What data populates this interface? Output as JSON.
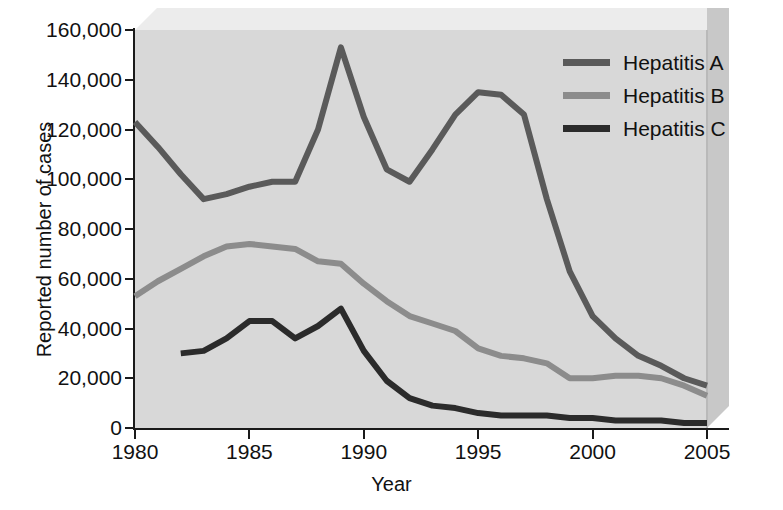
{
  "chart_data": {
    "type": "line",
    "title": "",
    "xlabel": "Year",
    "ylabel": "Reported number of cases",
    "xlim": [
      1980,
      2005
    ],
    "ylim": [
      0,
      160000
    ],
    "grid": false,
    "legend_position": "top-right",
    "x_ticks": [
      "1980",
      "1985",
      "1990",
      "1995",
      "2000",
      "2005"
    ],
    "x_tick_values": [
      1980,
      1985,
      1990,
      1995,
      2000,
      2005
    ],
    "y_ticks": [
      "0",
      "20,000",
      "40,000",
      "60,000",
      "80,000",
      "100,000",
      "120,000",
      "140,000",
      "160,000"
    ],
    "y_tick_values": [
      0,
      20000,
      40000,
      60000,
      80000,
      100000,
      120000,
      140000,
      160000
    ],
    "series": [
      {
        "name": "Hepatitis A",
        "color": "#5a5a5a",
        "x": [
          1980,
          1981,
          1982,
          1983,
          1984,
          1985,
          1986,
          1987,
          1988,
          1989,
          1990,
          1991,
          1992,
          1993,
          1994,
          1995,
          1996,
          1997,
          1998,
          1999,
          2000,
          2001,
          2002,
          2003,
          2004,
          2005
        ],
        "values": [
          123000,
          113000,
          102000,
          92000,
          94000,
          97000,
          99000,
          99000,
          120000,
          153000,
          125000,
          104000,
          99000,
          112000,
          126000,
          135000,
          134000,
          126000,
          92000,
          63000,
          45000,
          36000,
          29000,
          25000,
          20000,
          17000
        ]
      },
      {
        "name": "Hepatitis B",
        "color": "#8c8c8c",
        "x": [
          1980,
          1981,
          1982,
          1983,
          1984,
          1985,
          1986,
          1987,
          1988,
          1989,
          1990,
          1991,
          1992,
          1993,
          1994,
          1995,
          1996,
          1997,
          1998,
          1999,
          2000,
          2001,
          2002,
          2003,
          2004,
          2005
        ],
        "values": [
          53000,
          59000,
          64000,
          69000,
          73000,
          74000,
          73000,
          72000,
          67000,
          66000,
          58000,
          51000,
          45000,
          42000,
          39000,
          32000,
          29000,
          28000,
          26000,
          20000,
          20000,
          21000,
          21000,
          20000,
          17000,
          13000
        ]
      },
      {
        "name": "Hepatitis C",
        "color": "#2b2b2b",
        "x": [
          1982,
          1983,
          1984,
          1985,
          1986,
          1987,
          1988,
          1989,
          1990,
          1991,
          1992,
          1993,
          1994,
          1995,
          1996,
          1997,
          1998,
          1999,
          2000,
          2001,
          2002,
          2003,
          2004,
          2005
        ],
        "values": [
          30000,
          31000,
          36000,
          43000,
          43000,
          36000,
          41000,
          48000,
          31000,
          19000,
          12000,
          9000,
          8000,
          6000,
          5000,
          5000,
          5000,
          4000,
          4000,
          3000,
          3000,
          3000,
          2000,
          2000
        ]
      }
    ]
  },
  "legend": {
    "items": [
      {
        "label": "Hepatitis A",
        "color": "#5a5a5a"
      },
      {
        "label": "Hepatitis B",
        "color": "#8c8c8c"
      },
      {
        "label": "Hepatitis C",
        "color": "#2b2b2b"
      }
    ]
  }
}
